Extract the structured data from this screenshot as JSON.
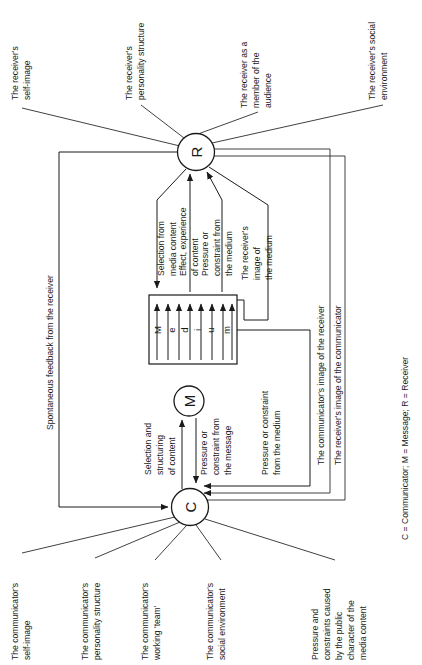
{
  "diagram": {
    "legend": "C = Communicator; M = Message; R = Receiver",
    "nodes": {
      "receiver": "R",
      "message": "M",
      "communicator": "C",
      "medium_letters": [
        "M",
        "e",
        "d",
        "i",
        "u",
        "m"
      ]
    },
    "receiver_labels": [
      "The receiver's self-image",
      "The receiver's personality structure",
      "The receiver as a member of the audience",
      "The receiver's social environment"
    ],
    "communicator_labels": [
      "The communicator's self-image",
      "The communicator's personality structure",
      "The communicator's working 'team'",
      "The communicator's social environment",
      "Pressure and constraints caused by the public character of the media content"
    ],
    "flow_labels": {
      "selection_from_media_content": "Selection from media content",
      "effect_experience_of_content": "Effect, experience of content",
      "pressure_constraint_from_medium_upper": "Pressure or constraint from the medium",
      "receivers_image_of_the_medium": "The receiver's image of the medium",
      "selection_and_structuring_of_content": "Selection and structuring of content",
      "pressure_constraint_from_the_message": "Pressure or constraint from the message",
      "pressure_constraint_from_medium_lower": "Pressure or constraint from the medium",
      "spontaneous_feedback": "Spontaneous feedback from the receiver",
      "communicators_image_of_receiver": "The communicator's image of the receiver",
      "receivers_image_of_communicator": "The receiver's image of the communicator"
    },
    "colors": {
      "ink": "#1a1a1a",
      "background": "#ffffff"
    }
  }
}
